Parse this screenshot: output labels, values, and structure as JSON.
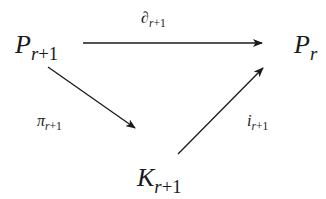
{
  "diagram": {
    "type": "commutative-triangle",
    "nodes": {
      "top_left": {
        "base": "P",
        "sub_var": "r",
        "sub_rest": "+1"
      },
      "top_right": {
        "base": "P",
        "sub_var": "r",
        "sub_rest": ""
      },
      "bottom": {
        "base": "K",
        "sub_var": "r",
        "sub_rest": "+1"
      }
    },
    "arrows": {
      "top": {
        "from": "top_left",
        "to": "top_right",
        "base": "∂",
        "sub_var": "r",
        "sub_rest": "+1"
      },
      "left": {
        "from": "top_left",
        "to": "bottom",
        "base": "π",
        "sub_var": "r",
        "sub_rest": "+1"
      },
      "right": {
        "from": "bottom",
        "to": "top_right",
        "base": "i",
        "sub_var": "r",
        "sub_rest": "+1"
      }
    },
    "colors": {
      "ink": "#1a1a1a",
      "background": "#ffffff"
    }
  }
}
